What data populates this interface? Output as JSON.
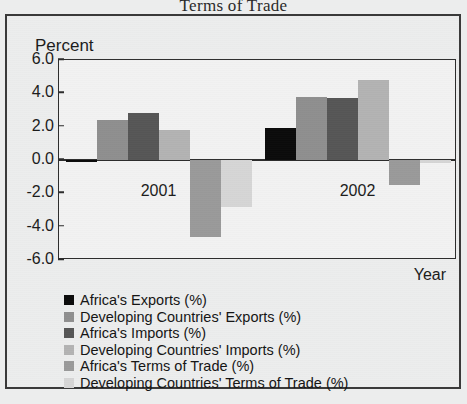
{
  "chart_data": {
    "type": "bar",
    "title": "Terms of Trade",
    "xlabel": "Year",
    "ylabel": "Percent",
    "categories": [
      "2001",
      "2002"
    ],
    "ylim": [
      -6.0,
      6.0
    ],
    "ytick_labels": [
      "6.0",
      "4.0",
      "2.0",
      "0.0",
      "-2.0",
      "-4.0",
      "-6.0"
    ],
    "ytick_values": [
      6.0,
      4.0,
      2.0,
      0.0,
      -2.0,
      -4.0,
      -6.0
    ],
    "grid": false,
    "legend_position": "below-plot-left",
    "series": [
      {
        "name": "Africa's Exports (%)",
        "color": "#0b0b0b",
        "values": [
          -0.1,
          1.9
        ]
      },
      {
        "name": "Developing Countries' Exports (%)",
        "color": "#8f8f8f",
        "values": [
          2.4,
          3.8
        ]
      },
      {
        "name": "Africa's Imports (%)",
        "color": "#565656",
        "values": [
          2.8,
          3.7
        ]
      },
      {
        "name": "Developing Countries' Imports (%)",
        "color": "#b3b3b3",
        "values": [
          1.8,
          4.8
        ]
      },
      {
        "name": "Africa's Terms of Trade (%)",
        "color": "#9a9a9a",
        "values": [
          -4.6,
          -1.5
        ]
      },
      {
        "name": "Developing Countries' Terms of Trade (%)",
        "color": "#d6d6d6",
        "values": [
          -2.8,
          -0.2
        ]
      }
    ]
  }
}
